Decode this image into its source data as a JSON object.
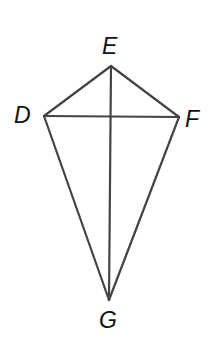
{
  "figure": {
    "shape": "kite",
    "line_color": "#444444",
    "background": "#ffffff",
    "vertices": {
      "E": {
        "label": "E",
        "x": 111,
        "y": 66
      },
      "D": {
        "label": "D",
        "x": 44,
        "y": 116
      },
      "F": {
        "label": "F",
        "x": 179,
        "y": 117
      },
      "G": {
        "label": "G",
        "x": 109,
        "y": 300
      }
    },
    "sides": [
      "ED",
      "EF",
      "DG",
      "FG"
    ],
    "diagonals": [
      "EG",
      "DF"
    ]
  }
}
